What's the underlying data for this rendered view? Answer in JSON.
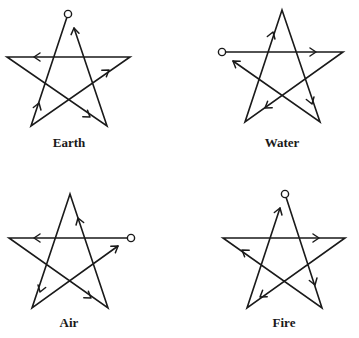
{
  "figure": {
    "stroke_color": "#1a1a1a",
    "background": "#ffffff"
  },
  "pentagrams": [
    {
      "label": "Earth",
      "label_pos": [
        69,
        146
      ],
      "start_marker": [
        68,
        14
      ],
      "path": [
        [
          68,
          14
        ],
        [
          31,
          126
        ],
        [
          130,
          57
        ],
        [
          7,
          57
        ],
        [
          107,
          126
        ],
        [
          74,
          28
        ]
      ],
      "arrows": [
        [
          39,
          103,
          -72
        ],
        [
          109,
          70,
          -35
        ],
        [
          34,
          57,
          180
        ],
        [
          90,
          117,
          36
        ],
        [
          74,
          28,
          -100
        ]
      ]
    },
    {
      "label": "Water",
      "label_pos": [
        282,
        146
      ],
      "start_marker": [
        222,
        52
      ],
      "path": [
        [
          222,
          52
        ],
        [
          343,
          52
        ],
        [
          245,
          122
        ],
        [
          282,
          10
        ],
        [
          320,
          122
        ],
        [
          233,
          61
        ]
      ],
      "arrows": [
        [
          316,
          52,
          0
        ],
        [
          265,
          108,
          145
        ],
        [
          273,
          32,
          -72
        ],
        [
          312,
          104,
          72
        ],
        [
          233,
          61,
          -145
        ]
      ]
    },
    {
      "label": "Air",
      "label_pos": [
        69,
        326
      ],
      "start_marker": [
        131,
        238
      ],
      "path": [
        [
          131,
          238
        ],
        [
          9,
          238
        ],
        [
          108,
          308
        ],
        [
          70,
          194
        ],
        [
          32,
          308
        ],
        [
          118,
          246
        ]
      ],
      "arrows": [
        [
          34,
          238,
          180
        ],
        [
          91,
          298,
          35
        ],
        [
          78,
          218,
          -108
        ],
        [
          40,
          292,
          108
        ],
        [
          118,
          246,
          -35
        ]
      ]
    },
    {
      "label": "Fire",
      "label_pos": [
        284,
        326
      ],
      "start_marker": [
        285,
        194
      ],
      "path": [
        [
          285,
          194
        ],
        [
          322,
          308
        ],
        [
          223,
          238
        ],
        [
          345,
          238
        ],
        [
          247,
          308
        ],
        [
          280,
          208
        ]
      ],
      "arrows": [
        [
          315,
          285,
          72
        ],
        [
          242,
          250,
          -145
        ],
        [
          319,
          238,
          0
        ],
        [
          260,
          297,
          145
        ],
        [
          280,
          208,
          -72
        ]
      ]
    }
  ]
}
